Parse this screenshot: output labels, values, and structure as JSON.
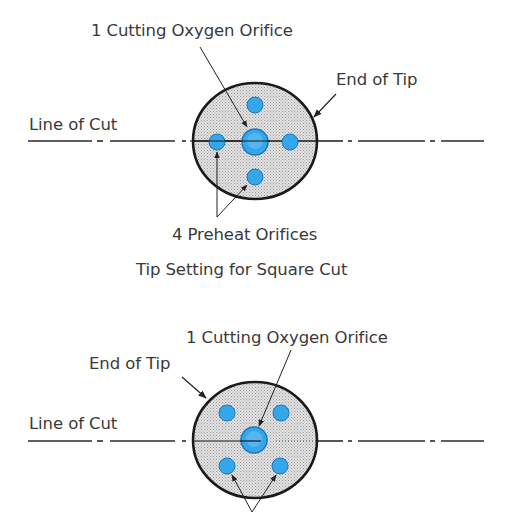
{
  "colors": {
    "text": "#3a3a3a",
    "outline": "#1a1a1a",
    "tip_fill": "#d4d4d4",
    "orifice_fill": "#36a6ea",
    "orifice_stroke": "#1a78c0",
    "line": "#2a2a2a"
  },
  "figure_top": {
    "labels": {
      "cutting_orifice": "1 Cutting Oxygen Orifice",
      "end_of_tip": "End of Tip",
      "line_of_cut": "Line of Cut",
      "preheat_orifices": "4 Preheat Orifices"
    },
    "caption": "Tip Setting for Square Cut",
    "tip": {
      "cx": 255,
      "cy": 141,
      "rx": 62,
      "ry": 58
    },
    "cutting_orifice": {
      "cx": 255,
      "cy": 142,
      "r": 13
    },
    "preheat_orifices": [
      {
        "cx": 255,
        "cy": 105,
        "r": 8
      },
      {
        "cx": 217,
        "cy": 142,
        "r": 8
      },
      {
        "cx": 290,
        "cy": 142,
        "r": 8
      },
      {
        "cx": 255,
        "cy": 177,
        "r": 8
      }
    ]
  },
  "figure_bottom": {
    "labels": {
      "cutting_orifice": "1 Cutting Oxygen Orifice",
      "end_of_tip": "End of Tip",
      "line_of_cut": "Line of Cut"
    },
    "tip": {
      "cx": 255,
      "cy": 440,
      "rx": 62,
      "ry": 58
    },
    "cutting_orifice": {
      "cx": 254,
      "cy": 440,
      "r": 13
    },
    "preheat_orifices": [
      {
        "cx": 227,
        "cy": 413,
        "r": 8
      },
      {
        "cx": 281,
        "cy": 413,
        "r": 8
      },
      {
        "cx": 227,
        "cy": 466,
        "r": 8
      },
      {
        "cx": 280,
        "cy": 466,
        "r": 8
      }
    ]
  }
}
